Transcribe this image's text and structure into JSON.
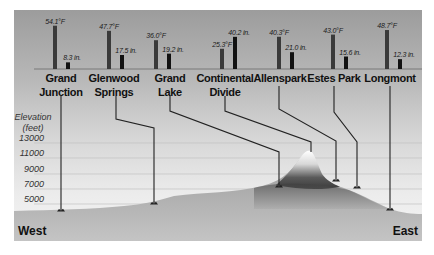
{
  "chart_data": {
    "type": "bar",
    "title": "",
    "subtitle": "Temperature and precipitation along an elevation profile, west to east",
    "categories": [
      "Grand Junction",
      "Glenwood Springs",
      "Grand Lake",
      "Continental Divide",
      "Allenspark",
      "Estes Park",
      "Longmont"
    ],
    "category_labels": [
      [
        "Grand",
        "Junction"
      ],
      [
        "Glenwood",
        "Springs"
      ],
      [
        "Grand",
        "Lake"
      ],
      [
        "Continental",
        "Divide"
      ],
      [
        "Allenspark"
      ],
      [
        "Estes Park"
      ],
      [
        "Longmont"
      ]
    ],
    "series": [
      {
        "name": "Mean annual temperature (°F)",
        "unit": "°F",
        "color": "#3a3a3a",
        "values": [
          54.1,
          47.7,
          36.0,
          25.3,
          40.3,
          43.0,
          48.7
        ],
        "labels": [
          "54.1°F",
          "47.7°F",
          "36.0°F",
          "25.3°F",
          "40.3°F",
          "43.0°F",
          "48.7°F"
        ]
      },
      {
        "name": "Annual precipitation (in.)",
        "unit": "in.",
        "color": "#111111",
        "values": [
          8.3,
          17.5,
          19.2,
          40.2,
          21.0,
          15.6,
          12.3
        ],
        "labels": [
          "8.3 in.",
          "17.5 in.",
          "19.2 in.",
          "40.2 in.",
          "21.0 in.",
          "15.6 in.",
          "12.3 in."
        ]
      }
    ],
    "elevation_axis": {
      "label_line1": "Elevation",
      "label_line2": "(feet)",
      "ticks": [
        "13000",
        "11000",
        "9000",
        "7000",
        "5000"
      ],
      "grid": true
    },
    "directions": {
      "left": "West",
      "right": "East"
    }
  }
}
